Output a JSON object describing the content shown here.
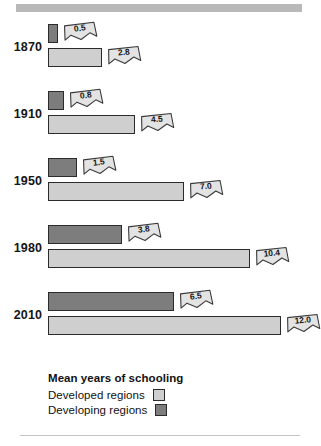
{
  "chart_data": {
    "type": "bar",
    "title": "Mean years of schooling",
    "orientation": "horizontal",
    "xlabel": "",
    "ylabel": "",
    "categories": [
      "1870",
      "1910",
      "1950",
      "1980",
      "2010"
    ],
    "series": [
      {
        "name": "Developing regions",
        "color": "#7d7d7d",
        "values": [
          0.5,
          0.8,
          1.5,
          3.8,
          6.5
        ]
      },
      {
        "name": "Developed regions",
        "color": "#cfcfcf",
        "values": [
          2.8,
          4.5,
          7.0,
          10.4,
          12.0
        ]
      }
    ],
    "value_labels": [
      {
        "category": "1870",
        "developing": "0.5",
        "developed": "2.8"
      },
      {
        "category": "1910",
        "developing": "0.8",
        "developed": "4.5"
      },
      {
        "category": "1950",
        "developing": "1.5",
        "developed": "7.0"
      },
      {
        "category": "1980",
        "developing": "3.8",
        "developed": "10.4"
      },
      {
        "category": "2010",
        "developing": "6.5",
        "developed": "12.0"
      }
    ],
    "xlim": [
      0,
      12.0
    ],
    "grid": false,
    "legend_position": "bottom-left"
  },
  "groups": [
    {
      "year": "1870",
      "developing": {
        "value": 0.5,
        "label": "0.5"
      },
      "developed": {
        "value": 2.8,
        "label": "2.8"
      }
    },
    {
      "year": "1910",
      "developing": {
        "value": 0.8,
        "label": "0.8"
      },
      "developed": {
        "value": 4.5,
        "label": "4.5"
      }
    },
    {
      "year": "1950",
      "developing": {
        "value": 1.5,
        "label": "1.5"
      },
      "developed": {
        "value": 7.0,
        "label": "7.0"
      }
    },
    {
      "year": "1980",
      "developing": {
        "value": 3.8,
        "label": "3.8"
      },
      "developed": {
        "value": 10.4,
        "label": "10.4"
      }
    },
    {
      "year": "2010",
      "developing": {
        "value": 6.5,
        "label": "6.5"
      },
      "developed": {
        "value": 12.0,
        "label": "12.0"
      }
    }
  ],
  "legend": {
    "title": "Mean years of schooling",
    "items": [
      {
        "label": "Developed regions",
        "swatch": "developed"
      },
      {
        "label": "Developing regions",
        "swatch": "developing"
      }
    ]
  },
  "colors": {
    "developed_fill": "#cfcfcf",
    "developing_fill": "#7d7d7d",
    "bar_outline": "#2b2b2b",
    "top_rule": "#b9b9b9",
    "bottom_rule": "#c4c4c4",
    "callout_fill": "#e3e3e3",
    "callout_outline": "#3a3a3a",
    "text": "#141414"
  }
}
